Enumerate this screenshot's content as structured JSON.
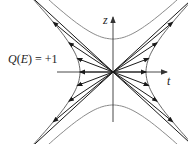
{
  "diagram": {
    "equation": {
      "Q": "Q",
      "open": "(",
      "E": "E",
      "close": ")",
      "rhs": " = +1"
    },
    "axes": {
      "z_label": "z",
      "t_label": "t"
    },
    "colors": {
      "axis": "#333333",
      "vectors": "#1a1a1a",
      "hyperbola_vectors": "#555555",
      "hyperbola_outer": "#8a8a8a"
    },
    "origin": [
      113,
      72
    ],
    "scale": 33,
    "vector_params": [
      -1.6,
      -1.2,
      -0.8,
      -0.4,
      0.0,
      0.4,
      0.8,
      1.2,
      1.6
    ]
  }
}
